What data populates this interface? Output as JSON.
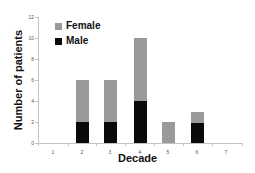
{
  "chart_data": {
    "type": "bar",
    "stacked": true,
    "title": "",
    "xlabel": "Decade",
    "ylabel": "Number of patients",
    "categories": [
      "1",
      "2",
      "3",
      "4",
      "5",
      "6",
      "7"
    ],
    "series": [
      {
        "name": "Male",
        "color": "#0a0a0a",
        "values": [
          0,
          2,
          2,
          4,
          0,
          2,
          0
        ]
      },
      {
        "name": "Female",
        "color": "#9a9a9a",
        "values": [
          0,
          4,
          4,
          6,
          2,
          1,
          0
        ]
      }
    ],
    "totals": [
      0,
      6,
      6,
      10,
      2,
      3,
      0
    ],
    "ylim": [
      0,
      12
    ],
    "yticks": [
      0,
      2,
      4,
      6,
      8,
      10,
      12
    ],
    "grid": false,
    "legend": {
      "position": "upper-left",
      "entries": [
        "Female",
        "Male"
      ]
    }
  },
  "legend": {
    "female_label": "Female",
    "male_label": "Male"
  },
  "axes": {
    "xlabel": "Decade",
    "ylabel": "Number of patients"
  }
}
